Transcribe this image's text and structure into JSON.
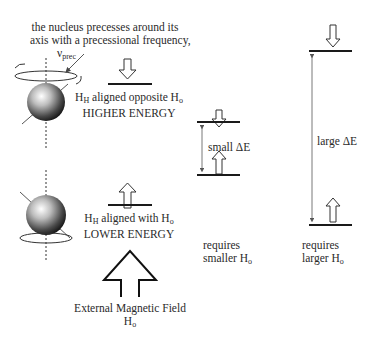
{
  "caption": {
    "line1": "the nucleus precesses around its",
    "line2": "axis with a precessional frequency,",
    "nu_symbol": "ν",
    "nu_sub": "prec"
  },
  "upper_state": {
    "label_prefix": "H",
    "label_prefix_sub": "H",
    "label_mid": " aligned opposite H",
    "label_suffix_sub": "o",
    "energy": "HIGHER ENERGY"
  },
  "lower_state": {
    "label_prefix": "H",
    "label_prefix_sub": "H",
    "label_mid": " aligned with H",
    "label_suffix_sub": "o",
    "energy": "LOWER ENERGY"
  },
  "field": {
    "line1": "External Magnetic Field",
    "line2_main": "H",
    "line2_sub": "o"
  },
  "small_gap": {
    "delta_label": "small ΔE",
    "req_line1": "requires",
    "req_line2_main": "smaller H",
    "req_line2_sub": "o"
  },
  "large_gap": {
    "delta_label": "large ΔE",
    "req_line1": "requires",
    "req_line2_main": "larger H",
    "req_line2_sub": "o"
  },
  "colors": {
    "line": "#1a1a1a",
    "arrow_stroke": "#333333",
    "text": "#2a2a2a"
  }
}
